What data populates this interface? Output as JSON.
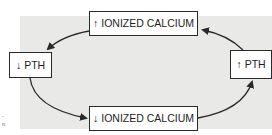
{
  "diagram": {
    "nodes": {
      "top": {
        "glyph": "↑",
        "label": "IONIZED CALCIUM"
      },
      "left": {
        "glyph": "↓",
        "label": "PTH"
      },
      "bottom": {
        "glyph": "↓",
        "label": "IONIZED CALCIUM"
      },
      "right": {
        "glyph": "↑",
        "label": "PTH"
      }
    },
    "edges": [
      {
        "from": "top",
        "to": "left"
      },
      {
        "from": "left",
        "to": "bottom"
      },
      {
        "from": "bottom",
        "to": "right"
      },
      {
        "from": "right",
        "to": "top"
      }
    ],
    "caption_fragments": [
      "-",
      "n."
    ],
    "colors": {
      "panel": "#e9e9e7",
      "stroke": "#2a2a2a",
      "box": "#ffffff"
    }
  }
}
